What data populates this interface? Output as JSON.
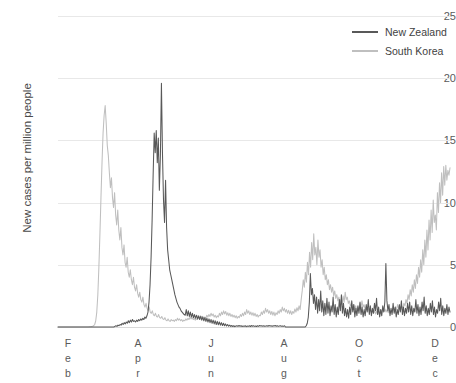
{
  "chart_data": {
    "type": "line",
    "title": "",
    "xlabel": "",
    "ylabel": "New cases per million people",
    "ylim": [
      0,
      25
    ],
    "yticks": [
      0,
      5,
      10,
      15,
      20,
      25
    ],
    "ytick_labels": [
      "0",
      "5",
      "10",
      "15",
      "20",
      "25"
    ],
    "xticks": [
      "Feb",
      "Apr",
      "Jun",
      "Aug",
      "Oct",
      "Dec"
    ],
    "xtick_letters": [
      [
        "F",
        "e",
        "b"
      ],
      [
        "A",
        "p",
        "r"
      ],
      [
        "J",
        "u",
        "n"
      ],
      [
        "A",
        "u",
        "g"
      ],
      [
        "O",
        "c",
        "t"
      ],
      [
        "D",
        "e",
        "c"
      ]
    ],
    "grid": true,
    "legend_position": "top-right",
    "colors": {
      "new_zealand": "#595959",
      "south_korea": "#bfbfbf",
      "gridline": "#e8e8e8",
      "text": "#5a5a5a",
      "background": "#ffffff"
    },
    "x_range_months": [
      1.0,
      12.2
    ],
    "series": [
      {
        "name": "New Zealand",
        "color": "#595959",
        "peak_value": 19.6,
        "peak_x": "early April",
        "values": [
          0,
          0,
          0,
          0,
          0,
          0,
          0,
          0,
          0,
          0,
          0,
          0,
          0,
          0,
          0,
          0,
          0,
          0,
          0,
          0,
          0,
          0,
          0,
          0,
          0,
          0,
          0,
          0,
          0,
          0,
          0,
          0,
          0,
          0,
          0,
          0,
          0,
          0,
          0,
          0,
          0,
          0,
          0,
          0,
          0,
          0,
          0,
          0,
          0,
          0,
          0,
          0,
          0,
          0,
          0,
          0.05,
          0.1,
          0.05,
          0.15,
          0.1,
          0.2,
          0.15,
          0.3,
          0.2,
          0.35,
          0.25,
          0.4,
          0.3,
          0.5,
          0.35,
          0.55,
          0.4,
          0.6,
          0.45,
          0.5,
          0.4,
          0.55,
          0.45,
          0.6,
          0.5,
          0.65,
          0.55,
          0.7,
          0.6,
          0.8,
          0.7,
          0.9,
          1.2,
          2.0,
          3.4,
          5.6,
          8.6,
          12.3,
          15.6,
          14.0,
          15.8,
          13.2,
          15.2,
          11.0,
          13.8,
          19.6,
          14.0,
          10.2,
          8.4,
          11.8,
          8.0,
          6.2,
          5.4,
          4.6,
          4.2,
          3.8,
          3.4,
          3.0,
          2.6,
          2.3,
          2.0,
          1.8,
          1.6,
          1.5,
          1.3,
          1.2,
          1.1,
          1.0,
          0.95,
          1.4,
          0.9,
          1.3,
          0.85,
          1.2,
          0.8,
          1.1,
          0.75,
          1.0,
          0.7,
          0.95,
          0.65,
          0.9,
          0.6,
          0.85,
          0.55,
          0.8,
          0.5,
          0.75,
          0.45,
          0.7,
          0.4,
          0.65,
          0.35,
          0.6,
          0.3,
          0.55,
          0.25,
          0.5,
          0.2,
          0.45,
          0.18,
          0.4,
          0.15,
          0.35,
          0.12,
          0.3,
          0.1,
          0.25,
          0.08,
          0.2,
          0.06,
          0.15,
          0.05,
          0.12,
          0.04,
          0.1,
          0.03,
          0.08,
          0.1,
          0.05,
          0.12,
          0.06,
          0.1,
          0.04,
          0.08,
          0.05,
          0.1,
          0.03,
          0.08,
          0.05,
          0.1,
          0.04,
          0.12,
          0.06,
          0.1,
          0.05,
          0.08,
          0.04,
          0.1,
          0.05,
          0.12,
          0.08,
          0.1,
          0.06,
          0.1,
          0.05,
          0.08,
          0.1,
          0.06,
          0.12,
          0.08,
          0.1,
          0.05,
          0.1,
          0.08,
          0.12,
          0.06,
          0.1,
          0.05,
          0.08,
          0.1,
          0.06,
          0.08,
          0.05,
          0.1,
          0,
          0,
          0,
          0,
          0,
          0,
          0,
          0,
          0,
          0,
          0,
          0,
          0,
          0,
          0,
          0,
          0,
          0,
          0,
          0,
          0.1,
          0.3,
          0.8,
          2.0,
          4.3,
          2.6,
          3.1,
          1.9,
          2.6,
          1.4,
          2.4,
          1.1,
          2.2,
          1.3,
          2.9,
          1.2,
          2.1,
          0.9,
          1.9,
          1.0,
          2.3,
          1.1,
          2.0,
          0.9,
          1.7,
          1.2,
          2.4,
          1.0,
          1.8,
          0.8,
          1.6,
          1.0,
          2.2,
          1.3,
          2.6,
          1.1,
          1.9,
          0.9,
          1.5,
          0.8,
          1.4,
          0.7,
          1.6,
          1.0,
          2.1,
          1.2,
          1.8,
          0.8,
          1.5,
          0.9,
          1.7,
          1.1,
          2.0,
          1.0,
          1.6,
          0.8,
          1.4,
          0.9,
          1.8,
          1.2,
          2.2,
          1.0,
          1.7,
          0.9,
          1.5,
          1.1,
          1.9,
          1.3,
          2.3,
          1.0,
          1.6,
          0.8,
          1.4,
          0.9,
          1.7,
          1.2,
          2.0,
          5.1,
          2.1,
          1.3,
          1.8,
          0.9,
          1.5,
          1.0,
          1.9,
          1.1,
          1.6,
          0.8,
          1.4,
          1.0,
          1.8,
          1.2,
          2.1,
          1.0,
          1.6,
          0.9,
          1.5,
          1.1,
          1.9,
          1.2,
          2.0,
          1.0,
          1.7,
          0.9,
          1.5,
          1.2,
          2.2,
          1.1,
          1.8,
          0.9,
          1.6,
          1.0,
          2.0,
          1.3,
          2.4,
          1.1,
          1.7,
          0.9,
          1.5,
          1.0,
          1.9,
          1.2,
          2.1,
          1.0,
          1.6,
          0.8,
          1.4,
          1.1,
          2.0,
          1.3,
          2.3,
          1.0,
          1.7,
          0.9,
          1.5,
          1.1,
          1.8,
          1.0,
          1.6,
          1.2
        ]
      },
      {
        "name": "South Korea",
        "color": "#bfbfbf",
        "peak_value": 17.8,
        "peak_x": "early March",
        "values": [
          0,
          0,
          0,
          0,
          0,
          0,
          0,
          0,
          0,
          0,
          0,
          0,
          0,
          0,
          0,
          0,
          0,
          0,
          0,
          0,
          0,
          0,
          0,
          0,
          0,
          0,
          0,
          0,
          0,
          0,
          0.02,
          0.02,
          0.04,
          0.06,
          0.1,
          0.2,
          0.5,
          1.2,
          2.6,
          4.8,
          7.5,
          10.4,
          13.2,
          15.6,
          17.0,
          17.8,
          16.4,
          14.6,
          13.8,
          12.4,
          11.2,
          12.0,
          10.4,
          9.6,
          10.8,
          9.0,
          8.2,
          9.4,
          7.8,
          7.0,
          8.0,
          6.4,
          5.8,
          6.6,
          5.2,
          4.8,
          5.6,
          4.4,
          4.0,
          4.6,
          3.8,
          3.4,
          4.0,
          3.2,
          2.9,
          3.4,
          2.7,
          2.4,
          2.8,
          2.2,
          2.0,
          2.4,
          1.8,
          1.6,
          1.9,
          1.5,
          1.3,
          1.6,
          1.2,
          1.1,
          1.3,
          1.0,
          0.9,
          1.1,
          0.85,
          0.8,
          1.0,
          0.75,
          0.7,
          0.85,
          0.65,
          0.6,
          0.75,
          0.55,
          0.5,
          0.65,
          0.5,
          0.45,
          0.6,
          0.5,
          0.55,
          0.45,
          0.6,
          0.5,
          0.7,
          0.55,
          0.65,
          0.5,
          0.6,
          0.45,
          0.55,
          0.5,
          0.65,
          0.55,
          0.7,
          0.6,
          0.8,
          0.65,
          0.75,
          0.6,
          0.7,
          0.55,
          0.65,
          0.6,
          0.8,
          0.7,
          0.9,
          0.75,
          0.85,
          0.65,
          0.8,
          0.7,
          0.95,
          0.8,
          1.0,
          0.85,
          1.1,
          0.9,
          1.05,
          0.8,
          0.95,
          0.75,
          0.9,
          0.8,
          1.1,
          0.9,
          1.2,
          1.0,
          1.3,
          1.05,
          1.25,
          0.95,
          1.15,
          0.9,
          1.1,
          0.85,
          1.0,
          0.8,
          0.95,
          0.75,
          0.9,
          0.7,
          0.85,
          0.75,
          1.0,
          0.85,
          1.1,
          0.9,
          1.2,
          1.0,
          1.4,
          1.1,
          1.3,
          1.0,
          1.2,
          0.95,
          1.15,
          0.9,
          1.1,
          0.85,
          1.0,
          0.8,
          0.95,
          0.9,
          1.2,
          1.0,
          1.3,
          1.1,
          1.5,
          1.2,
          1.4,
          1.1,
          1.3,
          1.0,
          1.25,
          0.95,
          1.2,
          0.9,
          1.15,
          1.0,
          1.3,
          1.1,
          1.4,
          1.2,
          1.6,
          1.3,
          1.5,
          1.2,
          1.4,
          1.1,
          1.35,
          1.05,
          1.3,
          1.0,
          1.25,
          1.1,
          1.45,
          1.2,
          1.55,
          1.3,
          1.7,
          1.4,
          2.2,
          2.9,
          3.8,
          3.2,
          4.4,
          3.6,
          5.2,
          4.2,
          6.0,
          4.8,
          6.8,
          5.4,
          7.5,
          5.8,
          6.4,
          5.0,
          7.0,
          5.6,
          6.2,
          4.8,
          5.4,
          4.2,
          4.8,
          3.8,
          4.2,
          3.4,
          3.8,
          3.0,
          3.4,
          2.8,
          3.2,
          2.5,
          2.9,
          2.3,
          2.6,
          2.1,
          2.4,
          1.9,
          2.2,
          1.8,
          2.5,
          2.0,
          2.8,
          2.2,
          2.4,
          1.9,
          2.1,
          1.7,
          1.9,
          1.5,
          1.8,
          1.4,
          1.7,
          1.3,
          1.6,
          1.3,
          1.9,
          1.5,
          2.1,
          1.6,
          1.8,
          1.4,
          1.6,
          1.3,
          1.5,
          1.2,
          1.4,
          1.15,
          1.35,
          1.1,
          1.3,
          1.05,
          1.25,
          1.0,
          1.2,
          1.1,
          1.4,
          1.2,
          1.5,
          1.25,
          1.45,
          1.2,
          1.4,
          1.15,
          1.35,
          1.1,
          1.3,
          1.2,
          1.5,
          1.3,
          1.6,
          1.4,
          1.8,
          1.5,
          1.7,
          1.4,
          1.65,
          1.5,
          1.9,
          1.7,
          2.2,
          1.9,
          2.6,
          2.2,
          3.0,
          2.5,
          3.4,
          2.8,
          3.8,
          3.1,
          4.2,
          3.5,
          4.8,
          4.0,
          5.4,
          4.4,
          6.2,
          5.0,
          7.0,
          5.6,
          7.8,
          6.2,
          8.6,
          7.0,
          9.4,
          7.6,
          10.2,
          8.4,
          9.0,
          7.8,
          10.8,
          9.2,
          11.6,
          10.0,
          12.4,
          10.6,
          12.9,
          11.4,
          13.0,
          11.8,
          12.6,
          12.2,
          12.8
        ]
      }
    ]
  },
  "legend": {
    "items": [
      {
        "label": "New Zealand",
        "color": "#595959"
      },
      {
        "label": "South Korea",
        "color": "#bfbfbf"
      }
    ]
  }
}
